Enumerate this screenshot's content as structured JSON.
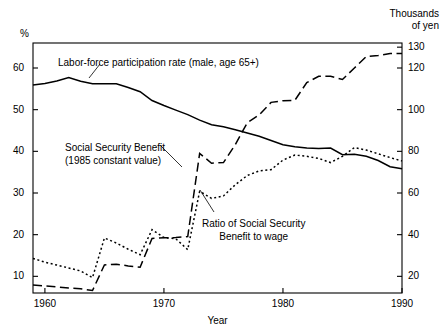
{
  "chart_data": {
    "type": "line",
    "title": "",
    "xlabel": "Year",
    "ylabel_left": "%",
    "ylabel_right_line1": "Thousands",
    "ylabel_right_line2": "of yen",
    "xlim": [
      1959,
      1990
    ],
    "ylim_left": [
      6,
      66
    ],
    "ylim_right": [
      12,
      132
    ],
    "grid": false,
    "legend_position": "inline-annotations",
    "xticks": [
      1960,
      1970,
      1980,
      1990
    ],
    "xticklabels": [
      "1960",
      "1970",
      "1980",
      "1990"
    ],
    "yticks_left": [
      10,
      20,
      30,
      40,
      50,
      60
    ],
    "yticklabels_left": [
      "10",
      "20",
      "30",
      "40",
      "50",
      "60"
    ],
    "yticks_right": [
      20,
      40,
      60,
      80,
      100,
      120,
      130
    ],
    "yticklabels_right": [
      "20",
      "40",
      "60",
      "80",
      "100",
      "120",
      "130"
    ],
    "annotations": [
      {
        "name": "labor-force-annotation",
        "text_lines": [
          "Labor-force participation rate (male, age 65+)"
        ],
        "x": 58,
        "y": 57
      },
      {
        "name": "social-security-benefit-annotation",
        "text_lines": [
          "Social Security Benefit",
          "(1985 constant value)"
        ],
        "x": 65,
        "y": 142
      },
      {
        "name": "ratio-to-wage-annotation",
        "text_lines": [
          "Ratio of Social Security",
          "Benefit to wage"
        ],
        "x": 202,
        "y": 218
      }
    ],
    "series": [
      {
        "name": "Labor-force participation rate (male, age 65+)",
        "axis": "left",
        "unit": "%",
        "style": "solid",
        "x": [
          1959,
          1960,
          1961,
          1962,
          1963,
          1964,
          1965,
          1966,
          1967,
          1968,
          1969,
          1970,
          1971,
          1972,
          1973,
          1974,
          1975,
          1976,
          1977,
          1978,
          1979,
          1980,
          1981,
          1982,
          1983,
          1984,
          1985,
          1986,
          1987,
          1988,
          1989,
          1990
        ],
        "values": [
          55.9,
          56.3,
          56.9,
          57.7,
          56.8,
          56.2,
          56.2,
          56.2,
          55.3,
          54.3,
          52.2,
          51.0,
          49.9,
          48.8,
          47.5,
          46.4,
          45.9,
          45.2,
          44.4,
          43.6,
          42.6,
          41.6,
          41.1,
          40.8,
          40.7,
          40.8,
          39.2,
          39.3,
          38.8,
          37.8,
          36.3,
          35.8
        ]
      },
      {
        "name": "Social Security Benefit (1985 constant value)",
        "axis": "right",
        "unit": "Thousands of yen",
        "style": "long-dash",
        "x": [
          1959,
          1960,
          1961,
          1962,
          1963,
          1964,
          1965,
          1966,
          1967,
          1968,
          1969,
          1970,
          1971,
          1972,
          1973,
          1974,
          1975,
          1976,
          1977,
          1978,
          1979,
          1980,
          1981,
          1982,
          1983,
          1984,
          1985,
          1986,
          1987,
          1988,
          1989,
          1990
        ],
        "values": [
          15.8,
          15.4,
          14.9,
          14.4,
          14.0,
          13.2,
          25.5,
          25.8,
          25.0,
          24.4,
          38.2,
          38.5,
          38.6,
          39.1,
          79.0,
          74.3,
          74.6,
          83.3,
          93.7,
          97.5,
          103.5,
          104.3,
          104.5,
          113.0,
          116.0,
          116.0,
          114.5,
          120.0,
          125.5,
          126.0,
          127.0,
          127.0
        ]
      },
      {
        "name": "Ratio of Social Security Benefit to wage",
        "axis": "left",
        "unit": "%",
        "style": "dotted",
        "x": [
          1959,
          1960,
          1961,
          1962,
          1963,
          1964,
          1965,
          1966,
          1967,
          1968,
          1969,
          1970,
          1971,
          1972,
          1973,
          1974,
          1975,
          1976,
          1977,
          1978,
          1979,
          1980,
          1981,
          1982,
          1983,
          1984,
          1985,
          1986,
          1987,
          1988,
          1989,
          1990
        ],
        "values": [
          14.3,
          13.4,
          12.7,
          12.0,
          11.3,
          9.7,
          19.2,
          18.0,
          16.5,
          15.2,
          21.2,
          19.3,
          19.0,
          16.4,
          30.4,
          28.7,
          29.3,
          32.0,
          34.2,
          35.3,
          35.6,
          37.9,
          39.1,
          38.8,
          38.3,
          37.3,
          38.8,
          40.9,
          40.3,
          39.4,
          38.5,
          37.7
        ]
      }
    ]
  },
  "leader_lines": [
    {
      "name": "labor-force-leader",
      "x1": 100,
      "y1": 64,
      "x2": 89,
      "y2": 78
    },
    {
      "name": "benefit-leader",
      "x1": 160,
      "y1": 145,
      "x2": 182,
      "y2": 167
    },
    {
      "name": "ratio-leader",
      "x1": 214,
      "y1": 212,
      "x2": 200,
      "y2": 190
    }
  ]
}
